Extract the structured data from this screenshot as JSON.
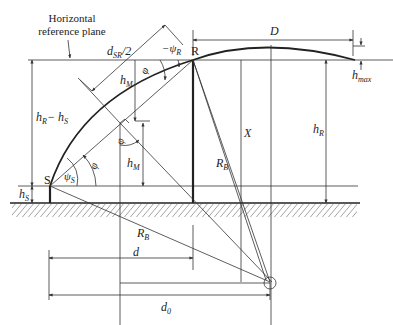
{
  "diagram": {
    "labels": {
      "reference_plane_line1": "Horizontal",
      "reference_plane_line2": "reference plane",
      "d_sr_half": "d",
      "d_sr_half_sub": "SR",
      "d_sr_half_suffix": "/2",
      "psi_r": "−ψ",
      "psi_r_sub": "R",
      "point_r": "R",
      "D": "D",
      "h_max": "h",
      "h_max_sub": "max",
      "h_m_upper": "h",
      "h_m_upper_sub": "M",
      "phi_upper": "φ",
      "h_r_minus_h_s": "h",
      "h_r_minus_h_s_sub1": "R",
      "h_r_minus_h_s_mid": "− h",
      "h_r_minus_h_s_sub2": "S",
      "phi_mid": "φ",
      "h_m_lower": "h",
      "h_m_lower_sub": "M",
      "X": "X",
      "h_r": "h",
      "h_r_sub": "R",
      "phi_lower": "φ",
      "psi_s": "ψ",
      "psi_s_sub": "S",
      "point_s": "S",
      "h_s": "h",
      "h_s_sub": "S",
      "r_b_right": "R",
      "r_b_right_sub": "B",
      "r_b_lower": "R",
      "r_b_lower_sub": "B",
      "d": "d",
      "d0": "d",
      "d0_sub": "0"
    },
    "colors": {
      "line": "#333333",
      "background": "#ffffff",
      "hatch": "#444444"
    }
  }
}
